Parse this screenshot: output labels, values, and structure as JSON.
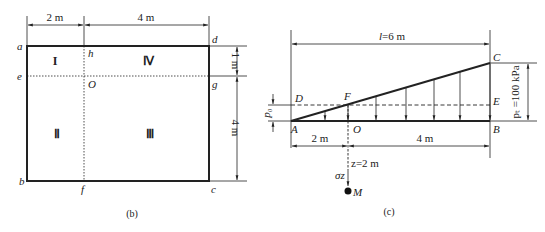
{
  "figure_b": {
    "caption": "(b)",
    "dims": {
      "top_left": "2 m",
      "top_right": "4 m",
      "right_top": "1 m",
      "right_bottom": "4 m"
    },
    "points": {
      "a": "a",
      "b": "b",
      "c": "c",
      "d": "d",
      "e": "e",
      "f": "f",
      "g": "g",
      "h": "h",
      "O": "O"
    },
    "regions": {
      "I": "I",
      "II": "Ⅱ",
      "III": "Ⅲ",
      "IV": "Ⅳ"
    }
  },
  "figure_c": {
    "caption": "(c)",
    "dims": {
      "top": "l=6 m",
      "bottom_left": "2 m",
      "bottom_right": "4 m",
      "depth": "z=2 m",
      "p0": "p₀",
      "pt": "pₜ =100 kPa"
    },
    "points": {
      "A": "A",
      "B": "B",
      "C": "C",
      "D": "D",
      "E": "E",
      "F": "F",
      "O": "O",
      "M": "M"
    },
    "stress_label": "σz"
  },
  "colors": {
    "line": "#222222",
    "background": "#ffffff"
  }
}
